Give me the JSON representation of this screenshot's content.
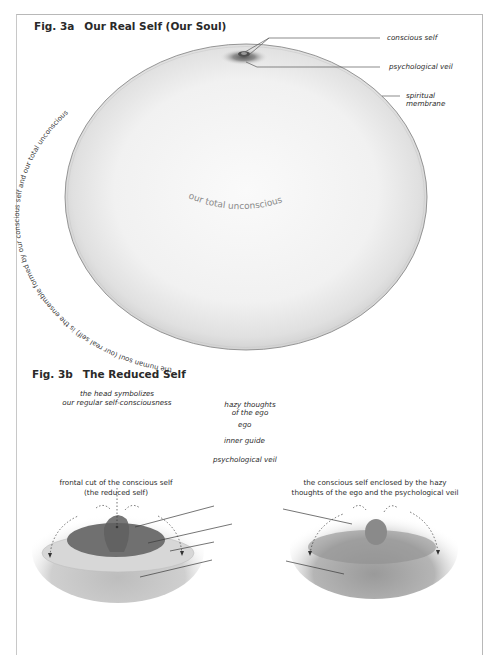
{
  "fig3a": {
    "number": "Fig. 3a",
    "title": "Our Real Self (Our Soul)",
    "center_label": "our total unconscious",
    "circumference_text": "the human soul (our real self) is the ensemble formed by our conscious self and our total unconscious",
    "callouts": {
      "conscious_self": "conscious self",
      "psychological_veil": "psychological veil",
      "spiritual_membrane_line1": "spiritual",
      "spiritual_membrane_line2": "membrane"
    }
  },
  "fig3b": {
    "number": "Fig. 3b",
    "title": "The Reduced Self",
    "head_note_line1": "the head symbolizes",
    "head_note_line2": "our regular self-consciousness",
    "callouts": {
      "hazy_line1": "hazy thoughts",
      "hazy_line2": "of the ego",
      "ego": "ego",
      "inner_guide": "inner guide",
      "psychological_veil": "psychological veil"
    },
    "left_caption_line1": "frontal cut of the conscious self",
    "left_caption_line2": "(the reduced self)",
    "right_caption_line1": "the conscious self enclosed by the hazy",
    "right_caption_line2": "thoughts of the ego and the psychological veil"
  },
  "colors": {
    "membrane": "#8a8a8a",
    "sphere_fill": "#f2f2f2",
    "ego_dark": "#6e6e6e",
    "inner_guide": "#d6d6d6",
    "veil": "#a9a9a9",
    "text": "#2a2a2a"
  }
}
